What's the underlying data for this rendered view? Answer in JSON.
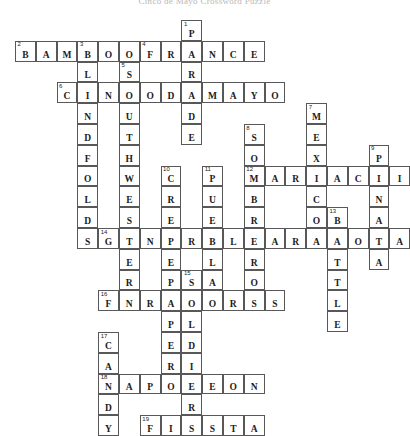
{
  "puzzle": {
    "title": "Cinco de Mayo Crossword Puzzle",
    "grid": {
      "cell_size": 20.8,
      "origin_x": 15,
      "origin_y": 20,
      "cols": 19,
      "rows": 19
    },
    "entries": [
      {
        "number": 1,
        "direction": "down",
        "answer": "PARADE",
        "row": 0,
        "col": 8
      },
      {
        "number": 2,
        "direction": "across",
        "answer": "BAMBOO",
        "row": 1,
        "col": 0
      },
      {
        "number": 3,
        "direction": "down",
        "answer": "BLINDFOLDS",
        "row": 1,
        "col": 3
      },
      {
        "number": 4,
        "direction": "across",
        "answer": "FRANCE",
        "row": 1,
        "col": 6
      },
      {
        "number": 5,
        "direction": "down",
        "answer": "SOUTHWESTERN",
        "row": 2,
        "col": 5
      },
      {
        "number": 6,
        "direction": "across",
        "answer": "CINCODEMAYO",
        "row": 3,
        "col": 2
      },
      {
        "number": 7,
        "direction": "down",
        "answer": "MEXICO",
        "row": 4,
        "col": 14
      },
      {
        "number": 8,
        "direction": "down",
        "answer": "SOMBREROS",
        "row": 5,
        "col": 11
      },
      {
        "number": 9,
        "direction": "down",
        "answer": "PINATA",
        "row": 6,
        "col": 17
      },
      {
        "number": 10,
        "direction": "down",
        "answer": "CREPEPAPER",
        "row": 7,
        "col": 7
      },
      {
        "number": 11,
        "direction": "down",
        "answer": "PUEBLA",
        "row": 7,
        "col": 9
      },
      {
        "number": 12,
        "direction": "across",
        "answer": "MARIACHI",
        "row": 7,
        "col": 11
      },
      {
        "number": 13,
        "direction": "down",
        "answer": "BATTLE",
        "row": 9,
        "col": 15
      },
      {
        "number": 14,
        "direction": "across",
        "answer": "GENERALZARAGOZA",
        "row": 10,
        "col": 4
      },
      {
        "number": 15,
        "direction": "down",
        "answer": "SOLDIERS",
        "row": 12,
        "col": 8
      },
      {
        "number": 16,
        "direction": "across",
        "answer": "FIREWORKS",
        "row": 13,
        "col": 4
      },
      {
        "number": 17,
        "direction": "down",
        "answer": "CANDY",
        "row": 15,
        "col": 4
      },
      {
        "number": 18,
        "direction": "across",
        "answer": "NAPOLEON",
        "row": 17,
        "col": 4
      },
      {
        "number": 19,
        "direction": "across",
        "answer": "FIESTA",
        "row": 19,
        "col": 6
      }
    ]
  },
  "colors": {
    "cell_border": "#585858",
    "cell_fill": "#ffffff",
    "letter": "#1b1b1b",
    "number": "#1b1b1b",
    "page_background": "#ffffff"
  }
}
